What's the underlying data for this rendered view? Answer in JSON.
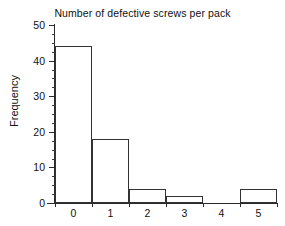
{
  "chart_data": {
    "type": "bar",
    "title": "Number of defective screws per pack",
    "xlabel": "",
    "ylabel": "Frequency",
    "categories": [
      "0",
      "1",
      "2",
      "3",
      "4",
      "5"
    ],
    "values": [
      44,
      18,
      4,
      2,
      0,
      4
    ],
    "ylim": [
      0,
      50
    ],
    "y_ticks": [
      0,
      10,
      20,
      30,
      40,
      50
    ],
    "y_tick_labels": [
      "0",
      "10",
      "20",
      "30",
      "40",
      "50"
    ],
    "y_minor_tick_interval": 2.5,
    "x_tick_labels": [
      "0",
      "1",
      "2",
      "3",
      "4",
      "5"
    ],
    "grid": false,
    "legend": false,
    "legend_position": "none",
    "series": [
      {
        "name": "Frequency",
        "values": [
          44,
          18,
          4,
          2,
          0,
          4
        ]
      }
    ],
    "colors": {
      "bar_fill": "#ffffff",
      "bar_edge": "#333333",
      "axis": "#2a2a2a",
      "text": "#111111",
      "background": "#ffffff"
    }
  }
}
